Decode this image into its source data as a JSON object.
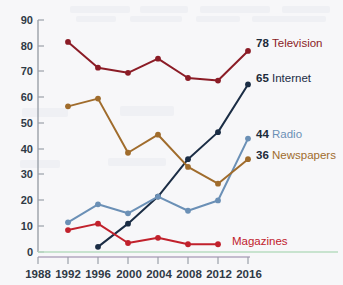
{
  "chart_data": {
    "type": "line",
    "title": "",
    "subtitle": "",
    "xlabel": "",
    "ylabel": "",
    "x": [
      1988,
      1992,
      1996,
      2000,
      2004,
      2008,
      2012,
      2016
    ],
    "xtick_labels": [
      "1988",
      "1992",
      "1996",
      "2000",
      "2004",
      "2008",
      "2012",
      "2016"
    ],
    "ytick_labels": [
      "0",
      "10",
      "20",
      "30",
      "40",
      "50",
      "60",
      "70",
      "80",
      "90"
    ],
    "yticks": [
      0,
      10,
      20,
      30,
      40,
      50,
      60,
      70,
      80,
      90
    ],
    "ylim": [
      0,
      90
    ],
    "xlim": [
      1988,
      2016
    ],
    "grid": false,
    "legend_position": "right-inline-end-labels",
    "series": [
      {
        "name": "Television",
        "color": "#8b1c26",
        "end_value": "78",
        "end_label": "Television",
        "x": [
          1992,
          1996,
          2000,
          2004,
          2008,
          2012,
          2016
        ],
        "values": [
          81.5,
          71.5,
          69.5,
          75,
          67.5,
          66.5,
          78
        ]
      },
      {
        "name": "Internet",
        "color": "#1b2d45",
        "end_value": "65",
        "end_label": "Internet",
        "x": [
          1996,
          2000,
          2004,
          2008,
          2012,
          2016
        ],
        "values": [
          2,
          11,
          21.5,
          36,
          46.5,
          65
        ]
      },
      {
        "name": "Radio",
        "color": "#6b90b6",
        "end_value": "44",
        "end_label": "Radio",
        "x": [
          1992,
          1996,
          2000,
          2004,
          2008,
          2012,
          2016
        ],
        "values": [
          11.5,
          18.5,
          15,
          21.5,
          16,
          20,
          44
        ]
      },
      {
        "name": "Newspapers",
        "color": "#a06c2c",
        "end_value": "36",
        "end_label": "Newspapers",
        "x": [
          1992,
          1996,
          2000,
          2004,
          2008,
          2012,
          2016
        ],
        "values": [
          56.5,
          59.5,
          38.5,
          45.5,
          33,
          26.5,
          36
        ]
      },
      {
        "name": "Magazines",
        "color": "#c1212c",
        "end_value": "",
        "end_label": "Magazines",
        "x": [
          1992,
          1996,
          2000,
          2004,
          2008,
          2012
        ],
        "values": [
          8.5,
          11,
          3.5,
          5.5,
          3,
          3
        ]
      }
    ],
    "axis_colors": {
      "y_axis": "#9aa0a8",
      "x_axis": "#b3a8bf",
      "zero_line": "#b9dcc0",
      "tick": "#9aa0a8"
    },
    "background": "#f7f7f9"
  }
}
